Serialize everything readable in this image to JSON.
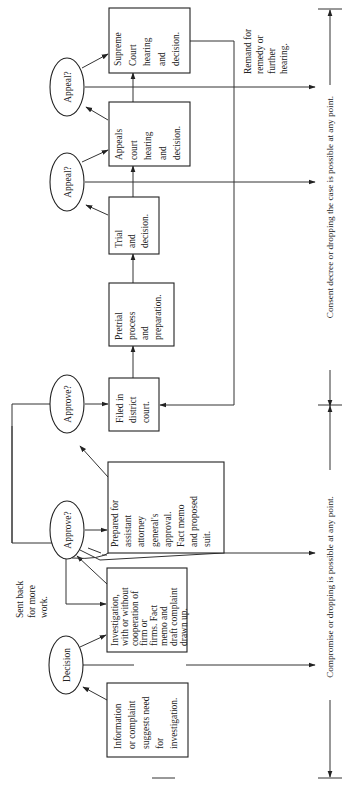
{
  "diagram": {
    "orientation": "rotated-90-ccw",
    "boxes": {
      "information": {
        "lines": [
          "Information",
          "or complaint",
          "suggests need",
          "for",
          "investigation."
        ]
      },
      "investigation": {
        "lines": [
          "Investigation,",
          "with or without",
          "cooperation of",
          "firm or",
          "firms. Fact",
          "memo and",
          "draft complaint",
          "drawn up."
        ]
      },
      "prepared": {
        "lines": [
          "Prepared for",
          "assistant",
          "attorney",
          "general's",
          "approval.",
          "Fact memo",
          "and proposed",
          "suit."
        ]
      },
      "filed": {
        "lines": [
          "Filed in",
          "district",
          "court."
        ]
      },
      "pretrial": {
        "lines": [
          "Pretrial",
          "process",
          "and",
          "preparation."
        ]
      },
      "trial": {
        "lines": [
          "Trial",
          "and",
          "decision."
        ]
      },
      "appeals_court": {
        "lines": [
          "Appeals",
          "court",
          "hearing",
          "and",
          "decision."
        ]
      },
      "supreme_court": {
        "lines": [
          "Supreme",
          "Court",
          "hearing",
          "and",
          "decision."
        ]
      }
    },
    "decisions": {
      "decision": "Decision",
      "approve_1": "Approve?",
      "approve_2": "Approve?",
      "appeal_1": "Appeal?",
      "appeal_2": "Appeal?"
    },
    "annotations": {
      "sent_back": [
        "Sent back",
        "for more",
        "work."
      ],
      "remand": [
        "Remand for",
        "remedy or",
        "further",
        "hearing."
      ]
    },
    "bands": {
      "compromise": "Compromise or dropping is possible at any point.",
      "consent": "Consent decree or dropping the case is possible at any point."
    }
  }
}
